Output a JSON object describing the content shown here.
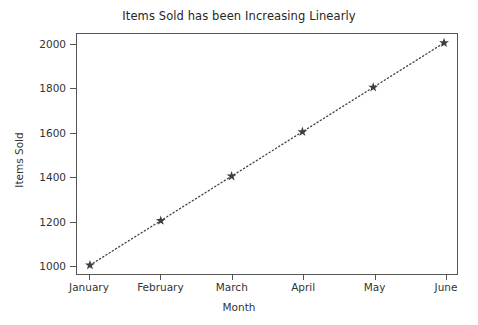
{
  "chart_data": {
    "type": "line",
    "title": "Items Sold has been Increasing Linearly",
    "xlabel": "Month",
    "ylabel": "Items Sold",
    "categories": [
      "January",
      "February",
      "March",
      "April",
      "May",
      "June"
    ],
    "values": [
      1000,
      1200,
      1400,
      1600,
      1800,
      2000
    ],
    "series": [
      {
        "name": "Items Sold",
        "values": [
          1000,
          1200,
          1400,
          1600,
          1800,
          2000
        ]
      }
    ],
    "ylim": [
      960,
      2040
    ],
    "yticks": [
      1000,
      1200,
      1400,
      1600,
      1800,
      2000
    ],
    "ytick_labels": [
      "1000",
      "1200",
      "1400",
      "1600",
      "1800",
      "2000"
    ],
    "xtick_labels": [
      "January",
      "February",
      "March",
      "April",
      "May",
      "June"
    ],
    "grid": false,
    "legend": false,
    "marker": "star",
    "linestyle": "dotted",
    "line_color": "#3f3f3f",
    "marker_color": "#3f3f3f",
    "background_color": "#ffffff",
    "axes_color": "#555555"
  }
}
